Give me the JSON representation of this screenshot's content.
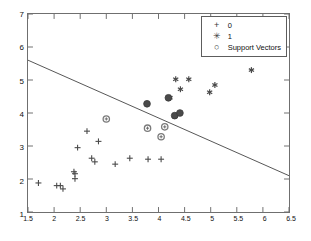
{
  "chart_data": {
    "type": "scatter",
    "title": "",
    "xlabel": "",
    "ylabel": "",
    "xlim": [
      1.5,
      6.5
    ],
    "ylim": [
      1,
      7
    ],
    "xticks": [
      "1.5",
      "2",
      "2.5",
      "3",
      "3.5",
      "4",
      "4.5",
      "5",
      "5.5",
      "6",
      "6.5"
    ],
    "xtick_values": [
      1.5,
      2,
      2.5,
      3,
      3.5,
      4,
      4.5,
      5,
      5.5,
      6,
      6.5
    ],
    "yticks": [
      "1",
      "2",
      "3",
      "4",
      "5",
      "6",
      "7"
    ],
    "ytick_values": [
      1,
      2,
      3,
      4,
      5,
      6,
      7
    ],
    "grid": false,
    "legend_position": "top-right",
    "legend": [
      {
        "label": "0",
        "marker": "plus-marker"
      },
      {
        "label": "1",
        "marker": "asterisk-marker"
      },
      {
        "label": "Support Vectors",
        "marker": "circle-marker"
      }
    ],
    "marker_color": "#4a4a4a",
    "line_color": "#555555",
    "axis_color": "#6f6f6f",
    "series": [
      {
        "name": "0",
        "marker": "plus",
        "points": [
          [
            1.7,
            1.88
          ],
          [
            2.05,
            1.8
          ],
          [
            2.12,
            1.8
          ],
          [
            2.17,
            1.7
          ],
          [
            2.38,
            2.22
          ],
          [
            2.4,
            2.16
          ],
          [
            2.4,
            2.01
          ],
          [
            2.45,
            2.95
          ],
          [
            2.63,
            3.45
          ],
          [
            2.72,
            2.63
          ],
          [
            2.78,
            2.52
          ],
          [
            2.85,
            3.14
          ],
          [
            3.17,
            2.45
          ],
          [
            3.45,
            2.63
          ],
          [
            3.8,
            2.6
          ],
          [
            4.05,
            2.6
          ]
        ]
      },
      {
        "name": "1",
        "marker": "asterisk",
        "points": [
          [
            4.33,
            5.02
          ],
          [
            4.42,
            4.72
          ],
          [
            4.58,
            5.02
          ],
          [
            4.98,
            4.63
          ],
          [
            5.08,
            4.85
          ],
          [
            5.78,
            5.3
          ],
          [
            4.22,
            4.46
          ],
          [
            4.32,
            3.92
          ]
        ]
      },
      {
        "name": "Support Vectors (class 1)",
        "marker": "filled-circle",
        "points": [
          [
            3.78,
            4.28
          ],
          [
            4.19,
            4.46
          ],
          [
            4.31,
            3.92
          ],
          [
            4.41,
            4.0
          ]
        ]
      },
      {
        "name": "Support Vectors (class 0)",
        "marker": "open-circle",
        "points": [
          [
            3.0,
            3.82
          ],
          [
            3.79,
            3.54
          ],
          [
            4.05,
            3.28
          ],
          [
            4.12,
            3.58
          ]
        ]
      }
    ],
    "decision_boundary": {
      "name": "decision-boundary-line",
      "x": [
        1.5,
        6.5
      ],
      "y": [
        5.6,
        2.1
      ]
    }
  }
}
